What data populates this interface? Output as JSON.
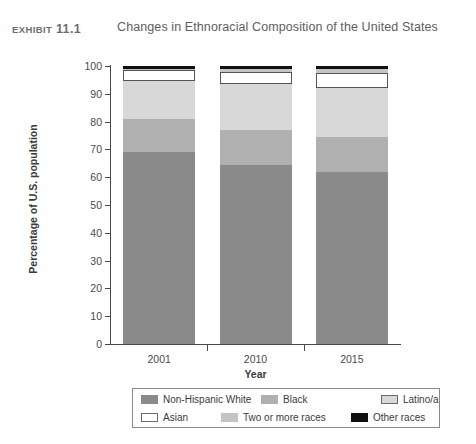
{
  "header": {
    "exhibit_word": "Exhibit",
    "exhibit_number": "11.1",
    "title": "Changes in Ethnoracial Composition of the United States"
  },
  "colors": {
    "non_hispanic_white": "#8a8a8a",
    "black": "#b0b0b0",
    "latino": "#d8d8d8",
    "asian": "#ffffff",
    "two_or_more_races": "#c4c4c4",
    "other_races": "#111111",
    "axis": "#4a4a4a",
    "text": "#3b3b3b",
    "legend_border": "#8a8a8a"
  },
  "chart_data": {
    "type": "bar",
    "subtype": "stacked-column-percent",
    "title": "Changes in Ethnoracial Composition of the United States",
    "xlabel": "Year",
    "ylabel": "Percentage of U.S. population",
    "categories": [
      "2001",
      "2010",
      "2015"
    ],
    "ylim": [
      0,
      100
    ],
    "yticks": [
      0,
      10,
      20,
      30,
      40,
      50,
      60,
      70,
      80,
      90,
      100
    ],
    "ytick_labels": [
      "0",
      "10",
      "20",
      "30",
      "40",
      "50",
      "60",
      "70",
      "80",
      "90",
      "100"
    ],
    "grid": false,
    "legend_position": "bottom",
    "stack_order_bottom_to_top": [
      "Non-Hispanic White",
      "Black",
      "Latino/a",
      "Asian",
      "Two or more races",
      "Other races"
    ],
    "series": [
      {
        "name": "Non-Hispanic White",
        "color": "#8a8a8a",
        "values": [
          69.0,
          64.5,
          62.0
        ]
      },
      {
        "name": "Black",
        "color": "#b0b0b0",
        "values": [
          12.0,
          12.5,
          12.5
        ]
      },
      {
        "name": "Latino/a",
        "color": "#d8d8d8",
        "values": [
          13.5,
          16.5,
          17.5
        ]
      },
      {
        "name": "Asian",
        "color": "#ffffff",
        "values": [
          4.0,
          4.5,
          5.5
        ]
      },
      {
        "name": "Two or more races",
        "color": "#c4c4c4",
        "values": [
          0.5,
          0.8,
          1.5
        ]
      },
      {
        "name": "Other races",
        "color": "#111111",
        "values": [
          1.0,
          1.2,
          1.0
        ]
      }
    ],
    "cumulative_tops": {
      "2001": [
        69.0,
        81.0,
        94.5,
        98.5,
        99.0,
        100.0
      ],
      "2010": [
        64.5,
        77.0,
        93.5,
        98.0,
        98.8,
        100.0
      ],
      "2015": [
        62.0,
        74.5,
        92.0,
        97.5,
        99.0,
        100.0
      ]
    }
  },
  "legend": {
    "row1": [
      {
        "label": "Non-Hispanic White",
        "color": "#8a8a8a",
        "outlined": false
      },
      {
        "label": "Black",
        "color": "#b0b0b0",
        "outlined": false
      },
      {
        "label": "Latino/a",
        "color": "#d8d8d8",
        "outlined": true
      }
    ],
    "row2": [
      {
        "label": "Asian",
        "color": "#ffffff",
        "outlined": true
      },
      {
        "label": "Two or more races",
        "color": "#c4c4c4",
        "outlined": false
      },
      {
        "label": "Other races",
        "color": "#111111",
        "outlined": false
      }
    ]
  }
}
